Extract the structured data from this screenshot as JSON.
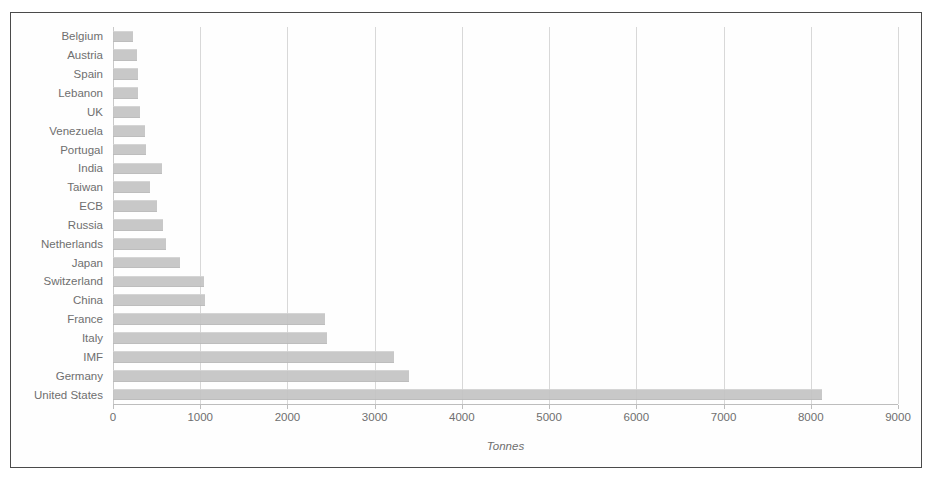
{
  "chart_data": {
    "type": "bar",
    "orientation": "horizontal",
    "title": "",
    "xlabel": "Tonnes",
    "ylabel": "",
    "xlim": [
      0,
      9000
    ],
    "xticks": [
      0,
      1000,
      2000,
      3000,
      4000,
      5000,
      6000,
      7000,
      8000,
      9000
    ],
    "xtick_labels": [
      "0",
      "1000",
      "2000",
      "3000",
      "4000",
      "5000",
      "6000",
      "7000",
      "8000",
      "9000"
    ],
    "grid": "vertical",
    "legend": "none",
    "bar_color": "#c4c4c4",
    "categories": [
      "Belgium",
      "Austria",
      "Spain",
      "Lebanon",
      "UK",
      "Venezuela",
      "Portugal",
      "India",
      "Taiwan",
      "ECB",
      "Russia",
      "Netherlands",
      "Japan",
      "Switzerland",
      "China",
      "France",
      "Italy",
      "IMF",
      "Germany",
      "United States"
    ],
    "values": [
      228,
      280,
      282,
      287,
      310,
      365,
      383,
      558,
      424,
      502,
      570,
      613,
      765,
      1040,
      1054,
      2435,
      2452,
      3217,
      3396,
      8134
    ]
  }
}
